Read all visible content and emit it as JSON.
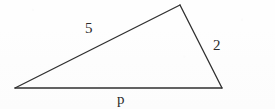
{
  "figure": {
    "kind": "geometry-triangle-diagram",
    "canvas": {
      "width": 275,
      "height": 109
    },
    "background_color": "#fefefe",
    "stroke_color": "#2f2f2f",
    "stroke_width": 1.3,
    "text_color": "#2b2b2b",
    "vertices": [
      {
        "name": "left-vertex",
        "x": 15,
        "y": 88
      },
      {
        "name": "apex-vertex",
        "x": 180,
        "y": 5
      },
      {
        "name": "right-vertex",
        "x": 222,
        "y": 88
      }
    ],
    "edges": [
      {
        "name": "upper-left-side",
        "from": "left-vertex",
        "to": "apex-vertex",
        "label": "5"
      },
      {
        "name": "right-side",
        "from": "apex-vertex",
        "to": "right-vertex",
        "label": "2"
      },
      {
        "name": "base-side",
        "from": "left-vertex",
        "to": "right-vertex",
        "label": "p"
      }
    ],
    "labels": {
      "upper_left_side": "5",
      "right_side": "2",
      "base_side": "p"
    }
  }
}
